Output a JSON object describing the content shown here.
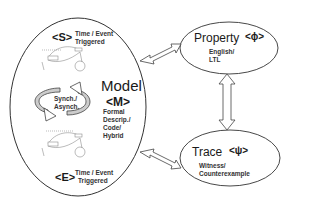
{
  "diagram": {
    "model": {
      "title": "Model",
      "symbol": "<M>",
      "description_lines": [
        "Formal",
        "Descrip./",
        "Code/",
        "Hybrid"
      ]
    },
    "start_state": {
      "symbol": "<S>",
      "line1": "Time / Event",
      "line2": "Triggered"
    },
    "end_state": {
      "symbol": "<E>",
      "line1": "Time / Event",
      "line2": "Triggered"
    },
    "cycle": {
      "line1": "Synch./",
      "line2": "Asynch."
    },
    "property": {
      "title": "Property",
      "symbol": "<ϕ>",
      "line1": "English/",
      "line2": "LTL"
    },
    "trace": {
      "title": "Trace",
      "symbol": "<ψ>",
      "line1": "Witness/",
      "line2": "Counterexample"
    },
    "connections": [
      {
        "from": "model",
        "to": "property",
        "type": "bidirectional"
      },
      {
        "from": "model",
        "to": "trace",
        "type": "bidirectional"
      },
      {
        "from": "property",
        "to": "trace",
        "type": "bidirectional"
      }
    ],
    "colors": {
      "stroke": "#333333",
      "cycle_fill": "#cccccc",
      "background": "#ffffff"
    }
  }
}
